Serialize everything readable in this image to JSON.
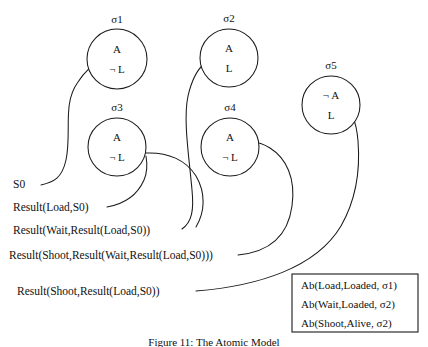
{
  "figure": {
    "caption": "Figure 11: The Atomic Model"
  },
  "nodes": [
    {
      "id": "sigma1",
      "name": "σ1",
      "line1": "A",
      "line2": "¬ L",
      "cx": 117,
      "cy": 59,
      "r": 30,
      "name_x": 117,
      "name_y": 23
    },
    {
      "id": "sigma2",
      "name": "σ2",
      "line1": "A",
      "line2": "L",
      "cx": 229,
      "cy": 58,
      "r": 29,
      "name_x": 229,
      "name_y": 22
    },
    {
      "id": "sigma3",
      "name": "σ3",
      "line1": "A",
      "line2": "¬ L",
      "cx": 117,
      "cy": 147,
      "r": 29,
      "name_x": 117,
      "name_y": 111
    },
    {
      "id": "sigma4",
      "name": "σ4",
      "line1": "A",
      "line2": "¬ L",
      "cx": 230,
      "cy": 147,
      "r": 29,
      "name_x": 230,
      "name_y": 111
    },
    {
      "id": "sigma5",
      "name": "σ5",
      "line1": "¬ A",
      "line2": "L",
      "cx": 331,
      "cy": 105,
      "r": 29,
      "name_x": 331,
      "name_y": 69
    }
  ],
  "situations": [
    {
      "id": "s0",
      "label": "S0",
      "x": 13,
      "y": 188
    },
    {
      "id": "s_load",
      "label": "Result(Load,S0)",
      "x": 13,
      "y": 211
    },
    {
      "id": "s_wait",
      "label": "Result(Wait,Result(Load,S0))",
      "x": 13,
      "y": 234
    },
    {
      "id": "s_shoot_wait",
      "label": "Result(Shoot,Result(Wait,Result(Load,S0)))",
      "x": 9,
      "y": 259
    },
    {
      "id": "s_shoot_load",
      "label": "Result(Shoot,Result(Load,S0))",
      "x": 17,
      "y": 295
    }
  ],
  "edges": [
    {
      "id": "edge-s0-sigma1",
      "from": "s0",
      "to": "sigma1",
      "d": "M 41,185 C 54,182 62,178 66,160 C 72,132 62,104 78,82 C 85,71 92,65 101,61"
    },
    {
      "id": "edge-load-sigma3",
      "from": "s_load",
      "to": "sigma3",
      "d": "M 107,207 C 124,204 137,196 144,180 C 148,171 147,162 146,156"
    },
    {
      "id": "edge-wait-sigma2",
      "from": "s_wait",
      "to": "sigma2",
      "d": "M 182,229 C 192,222 194,210 192,190 C 189,156 183,120 188,96 C 192,79 198,69 204,64"
    },
    {
      "id": "edge-shootwait-sigma4",
      "from": "s_shoot_wait",
      "to": "sigma4",
      "d": "M 238,255 C 269,252 288,236 292,206 C 296,178 286,158 270,148 C 262,143 256,142 252,142"
    },
    {
      "id": "edge-shootload-sigma5",
      "from": "s_shoot_load",
      "to": "sigma5",
      "d": "M 196,291 C 258,286 316,268 341,226 C 357,198 360,166 358,141 C 357,129 355,122 353,118"
    },
    {
      "id": "edge-sigma3-sigma4-arc",
      "from": "sigma3",
      "to": "sigma4",
      "d": "M 146,153 C 168,152 186,160 196,176 C 206,193 205,212 196,227"
    }
  ],
  "legend": {
    "x": 292,
    "y": 274,
    "width": 126,
    "height": 58,
    "lines": [
      "Ab(Load,Loaded, σ1)",
      "Ab(Wait,Loaded, σ2)",
      "Ab(Shoot,Alive, σ2)"
    ]
  }
}
